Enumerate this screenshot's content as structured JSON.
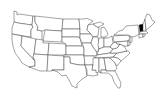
{
  "map": {
    "title": "United States map",
    "region": "Contiguous United States",
    "highlighted_states": [
      "Vermont"
    ],
    "highlight_color": "#000000",
    "fill_color": "#ffffff",
    "border_color": "#333333"
  }
}
